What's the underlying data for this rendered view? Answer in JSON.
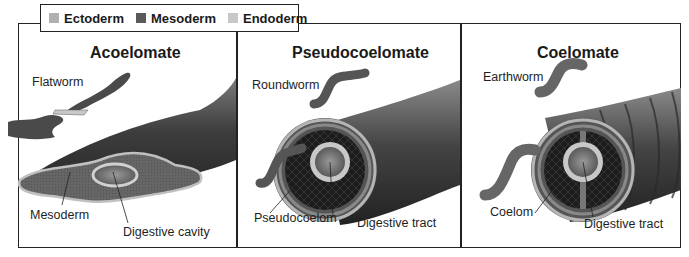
{
  "legend": {
    "items": [
      {
        "label": "Ectoderm",
        "color": "#b0b0b0"
      },
      {
        "label": "Mesoderm",
        "color": "#5a5a5a"
      },
      {
        "label": "Endoderm",
        "color": "#c8c8c8"
      }
    ]
  },
  "panels": [
    {
      "title": "Acoelomate",
      "organism": "Flatworm",
      "labels": [
        "Mesoderm",
        "Digestive cavity"
      ]
    },
    {
      "title": "Pseudocoelomate",
      "organism": "Roundworm",
      "labels": [
        "Pseudocoelom",
        "Digestive tract"
      ]
    },
    {
      "title": "Coelomate",
      "organism": "Earthworm",
      "labels": [
        "Coelom",
        "Digestive tract"
      ]
    }
  ],
  "colors": {
    "border": "#222222",
    "body_dark": "#3a3a3a",
    "body_mid": "#6b6b6b",
    "ecto_ring": "#b5b5b5",
    "endo_ring": "#d0d0d0"
  }
}
